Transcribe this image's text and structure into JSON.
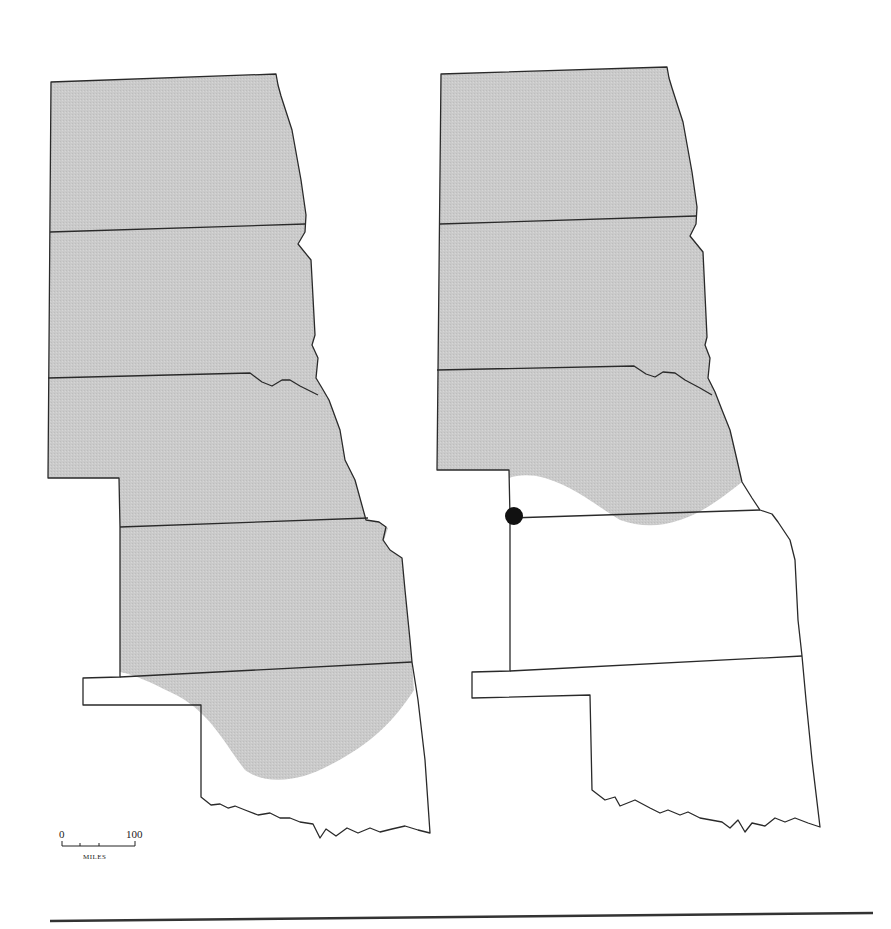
{
  "figure": {
    "panels": [
      {
        "id": "left-map",
        "description": "Shaded range covering ND, SD, NE, KS and northern/central Oklahoma"
      },
      {
        "id": "right-map",
        "description": "Shaded range covering ND, SD and most of NE; single locality dot at NE-KS-CO corner"
      }
    ],
    "scale_bar": {
      "start_label": "0",
      "end_label": "100",
      "unit_label": "MILES"
    },
    "colors": {
      "shading": "#c9c9c9",
      "outline": "#2a2a2a",
      "locality_dot": "#111111",
      "rule": "#333333"
    }
  }
}
